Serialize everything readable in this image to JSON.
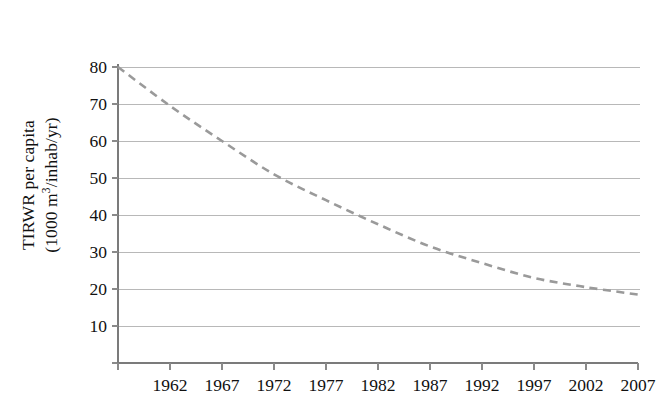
{
  "chart_data": {
    "type": "line",
    "title": "",
    "subtitle": "",
    "xlabel": "",
    "ylabel": "TIRWR per capita (1000 m3/inhab/yr)",
    "ylabel_line1": "TIRWR per capita",
    "ylabel_line2_prefix": "(1000 m",
    "ylabel_line2_sup": "3",
    "ylabel_line2_suffix": "/inhab/yr)",
    "x": [
      1962,
      1967,
      1972,
      1977,
      1982,
      1987,
      1992,
      1997,
      2002,
      2007,
      2012
    ],
    "values": [
      80,
      69.5,
      60,
      51,
      44,
      37.5,
      31.5,
      27,
      23,
      20.5,
      18.5
    ],
    "series": [
      {
        "name": "TIRWR per capita",
        "values": [
          80,
          69.5,
          60,
          51,
          44,
          37.5,
          31.5,
          27,
          23,
          20.5,
          18.5
        ],
        "style": "dashed",
        "color": "#9a9a9a"
      }
    ],
    "categories": [
      "1962",
      "1967",
      "1972",
      "1977",
      "1982",
      "1987",
      "1992",
      "1997",
      "2002",
      "2007",
      "2012"
    ],
    "xticklabels": [
      "1962",
      "1967",
      "1972",
      "1977",
      "1982",
      "1987",
      "1992",
      "1997",
      "2002",
      "2007",
      "2012"
    ],
    "yticklabels": [
      "80",
      "70",
      "60",
      "50",
      "40",
      "30",
      "20",
      "10"
    ],
    "yticks": [
      80,
      70,
      60,
      50,
      40,
      30,
      20,
      10
    ],
    "xlim": [
      1962,
      2013.5
    ],
    "ylim": [
      0,
      80
    ],
    "grid": "horizontal",
    "legend": "none",
    "background_color": "#ffffff",
    "gridline_color": "#b8b8b8",
    "axis_color": "#7b7b7b",
    "text_color": "#111111"
  },
  "ytick_labels": {
    "t0": "80",
    "t1": "70",
    "t2": "60",
    "t3": "50",
    "t4": "40",
    "t5": "30",
    "t6": "20",
    "t7": "10"
  },
  "xtick_labels": {
    "t0": "1962",
    "t1": "1967",
    "t2": "1972",
    "t3": "1977",
    "t4": "1982",
    "t5": "1987",
    "t6": "1992",
    "t7": "1997",
    "t8": "2002",
    "t9": "2007",
    "t10": "2012"
  }
}
